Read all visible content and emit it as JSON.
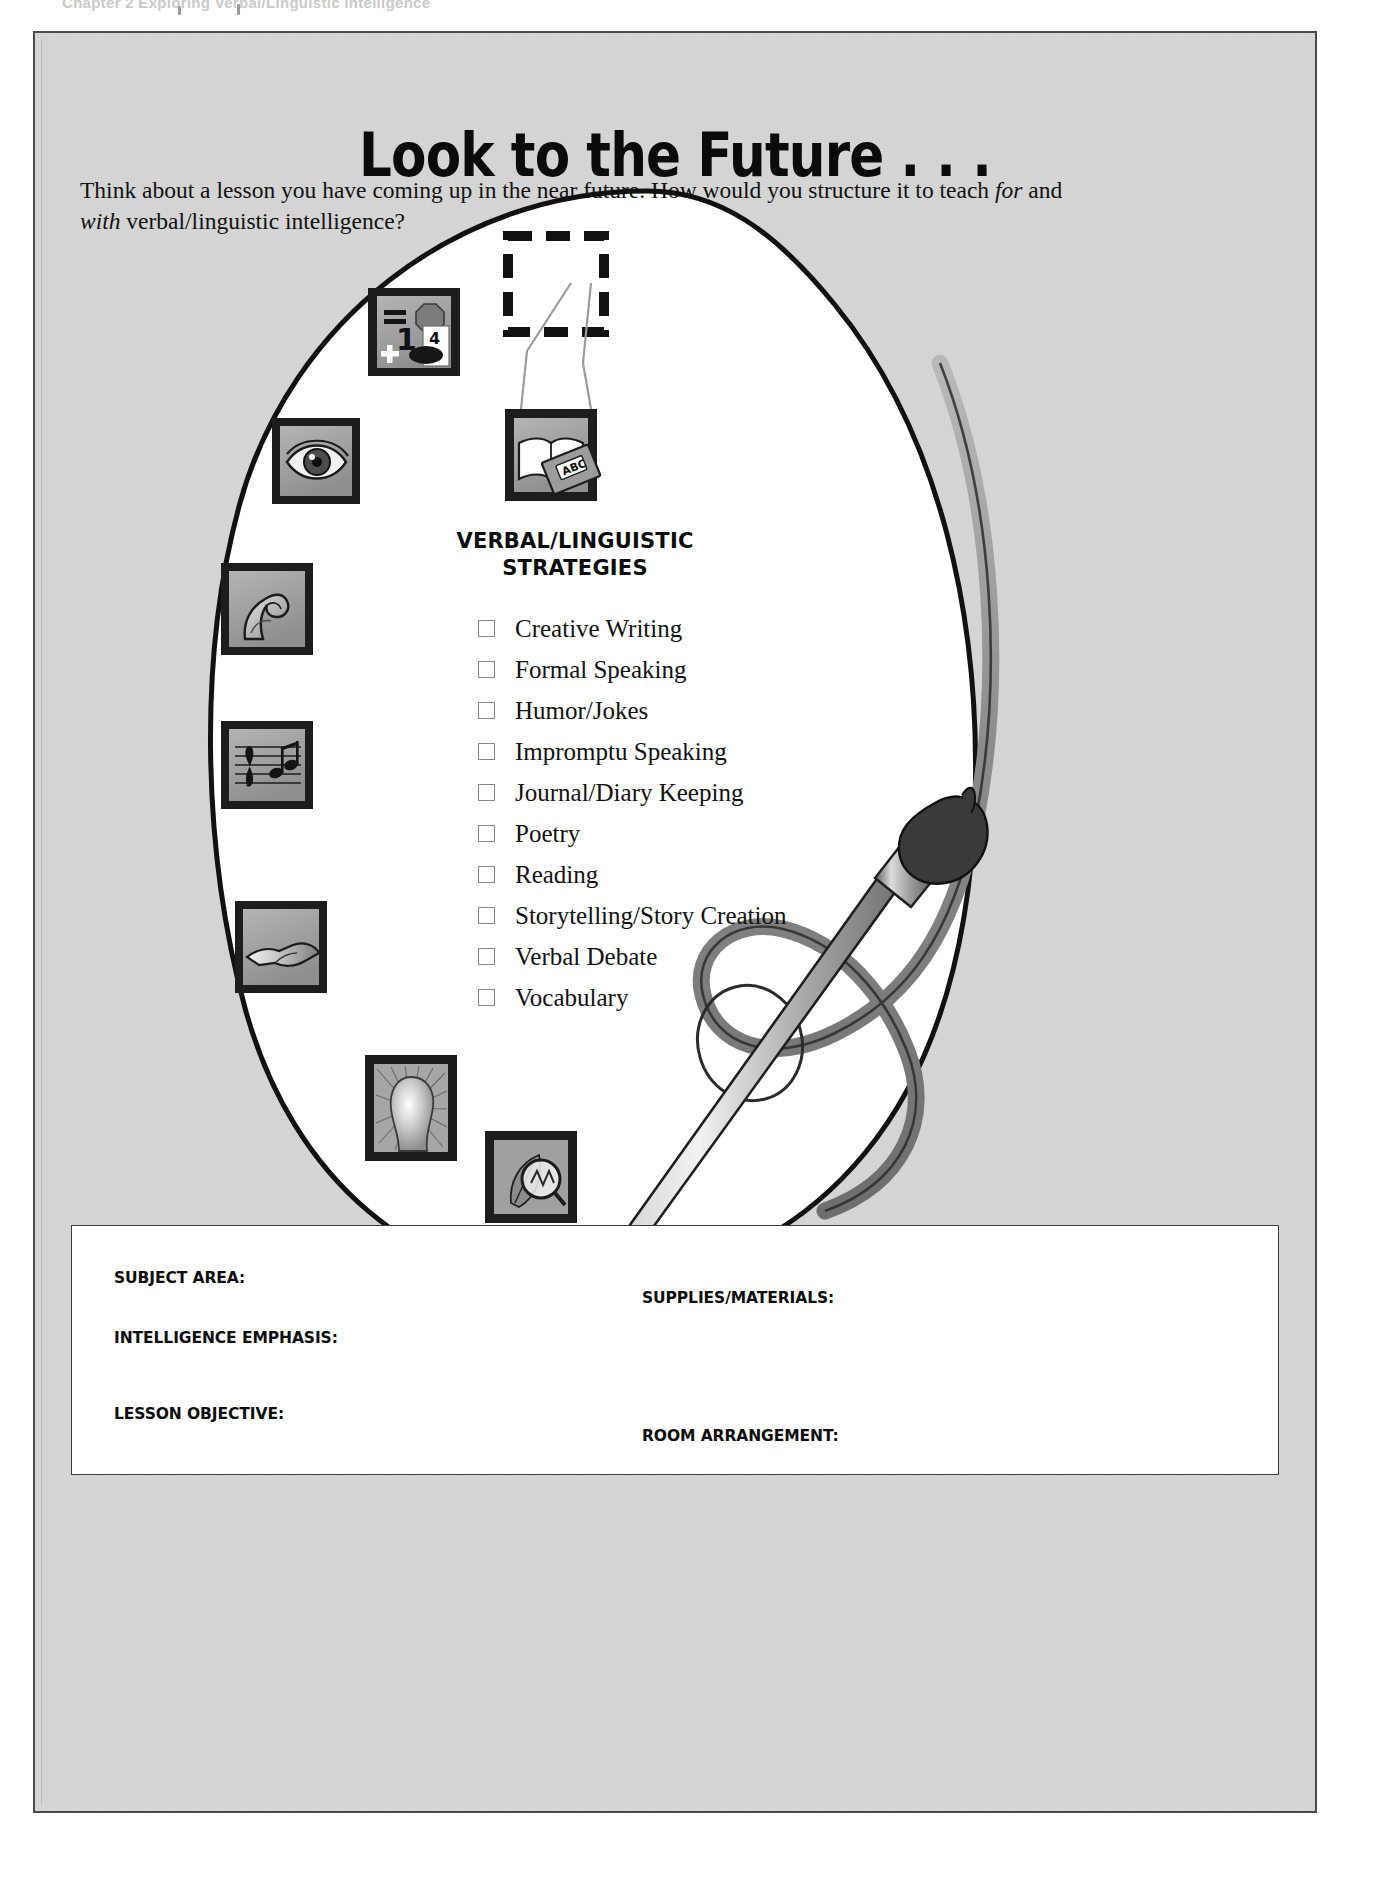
{
  "running_head": "Chapter 2  Exploring Verbal/Linguistic Intelligence",
  "title": "Look to the Future . . .",
  "intro": {
    "part1": "Think about a lesson you have coming up in the near future. How would you structure it to teach ",
    "em1": "for",
    "part2": " and ",
    "em2": "with",
    "part3": " verbal/linguistic intelligence?"
  },
  "strategies": {
    "heading_line1": "VERBAL/LINGUISTIC",
    "heading_line2": "STRATEGIES",
    "items": [
      "Creative Writing",
      "Formal Speaking",
      "Humor/Jokes",
      "Impromptu Speaking",
      "Journal/Diary Keeping",
      "Poetry",
      "Reading",
      "Storytelling/Story Creation",
      "Verbal Debate",
      "Vocabulary"
    ]
  },
  "form": {
    "subject_area": "SUBJECT AREA:",
    "supplies_materials": "SUPPLIES/MATERIALS:",
    "intelligence_emphasis": "INTELLIGENCE EMPHASIS:",
    "lesson_objective": "LESSON OBJECTIVE:",
    "room_arrangement": "ROOM ARRANGEMENT:"
  },
  "icons": {
    "logical_mathematical": {
      "equals": "=",
      "one": "1",
      "plus": "+",
      "four": "4"
    },
    "verbal_linguistic_book": "ABC",
    "visual_spatial": "eye-icon",
    "bodily_kinesthetic": "flexed-arm-icon",
    "musical_rhythmic": "music-staff-icon",
    "interpersonal": "handshake-icon",
    "intrapersonal": "glowing-head-icon",
    "naturalist": "leaf-magnifier-icon",
    "callout": "dashed-zoom-box"
  },
  "colors": {
    "page_background": "#d6d6d6",
    "palette_fill": "#ffffff",
    "ink": "#111111",
    "tile_border": "#1d1d1d",
    "tile_fill": "#9e9e9e",
    "brush_gray": "#8d8d8d"
  }
}
